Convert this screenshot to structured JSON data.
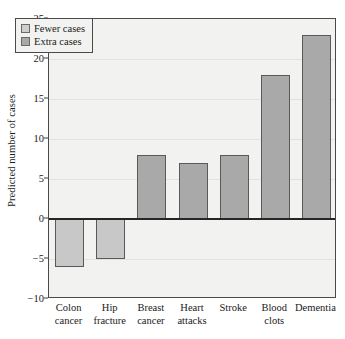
{
  "chart_data": {
    "type": "bar",
    "title": "",
    "subtitle": "",
    "xlabel": "",
    "ylabel": "Predicted number of cases",
    "ylim": [
      -10,
      25
    ],
    "yticks": [
      25,
      20,
      15,
      10,
      5,
      0,
      -5,
      -10
    ],
    "ytick_labels": [
      "25",
      "20",
      "15",
      "10",
      "5",
      "0",
      "−5",
      "−10"
    ],
    "grid": true,
    "grid_axis": "y",
    "zero_line": true,
    "legend_position": "upper left",
    "categories": [
      "Colon cancer",
      "Hip fracture",
      "Breast cancer",
      "Heart attacks",
      "Stroke",
      "Blood clots",
      "Dementia"
    ],
    "category_lines": [
      [
        "Colon",
        "cancer"
      ],
      [
        "Hip",
        "fracture"
      ],
      [
        "Breast",
        "cancer"
      ],
      [
        "Heart",
        "attacks"
      ],
      [
        "Stroke",
        ""
      ],
      [
        "Blood",
        "clots"
      ],
      [
        "Dementia",
        ""
      ]
    ],
    "values": [
      -6,
      -5,
      8,
      7,
      8,
      18,
      23
    ],
    "bar_groups": [
      "Fewer cases",
      "Fewer cases",
      "Extra cases",
      "Extra cases",
      "Extra cases",
      "Extra cases",
      "Extra cases"
    ],
    "legend": [
      {
        "label": "Fewer cases",
        "color": "#cfcfcf"
      },
      {
        "label": "Extra cases",
        "color": "#a9a9a9"
      }
    ],
    "colors": {
      "fewer_cases": "#cfcfcf",
      "extra_cases": "#a9a9a9",
      "bar_edge": "#595959",
      "plot_background": "#f2f2f0",
      "gridline": "#e2e2e0",
      "axis": "#4a4a4a",
      "zero_line": "#262626",
      "text": "#1a1a1a",
      "figure_background": "#ffffff"
    }
  }
}
